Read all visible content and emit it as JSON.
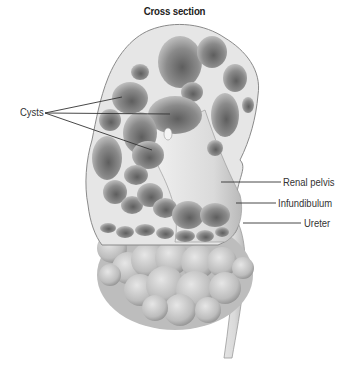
{
  "figure": {
    "title": "Cross section",
    "labels": {
      "left": [
        {
          "text": "Cysts",
          "pointer_count": 3
        }
      ],
      "right": [
        {
          "text": "Renal pelvis"
        },
        {
          "text": "Infundibulum"
        },
        {
          "text": "Ureter"
        }
      ]
    },
    "colors": {
      "background": "#ffffff",
      "tissue": "#e8e8e8",
      "cyst_dark": "#6a6a6a",
      "cyst_light": "#c4c4c4",
      "outline": "#8a8a8a",
      "leader_line": "#333333",
      "label_text": "#333333"
    }
  }
}
